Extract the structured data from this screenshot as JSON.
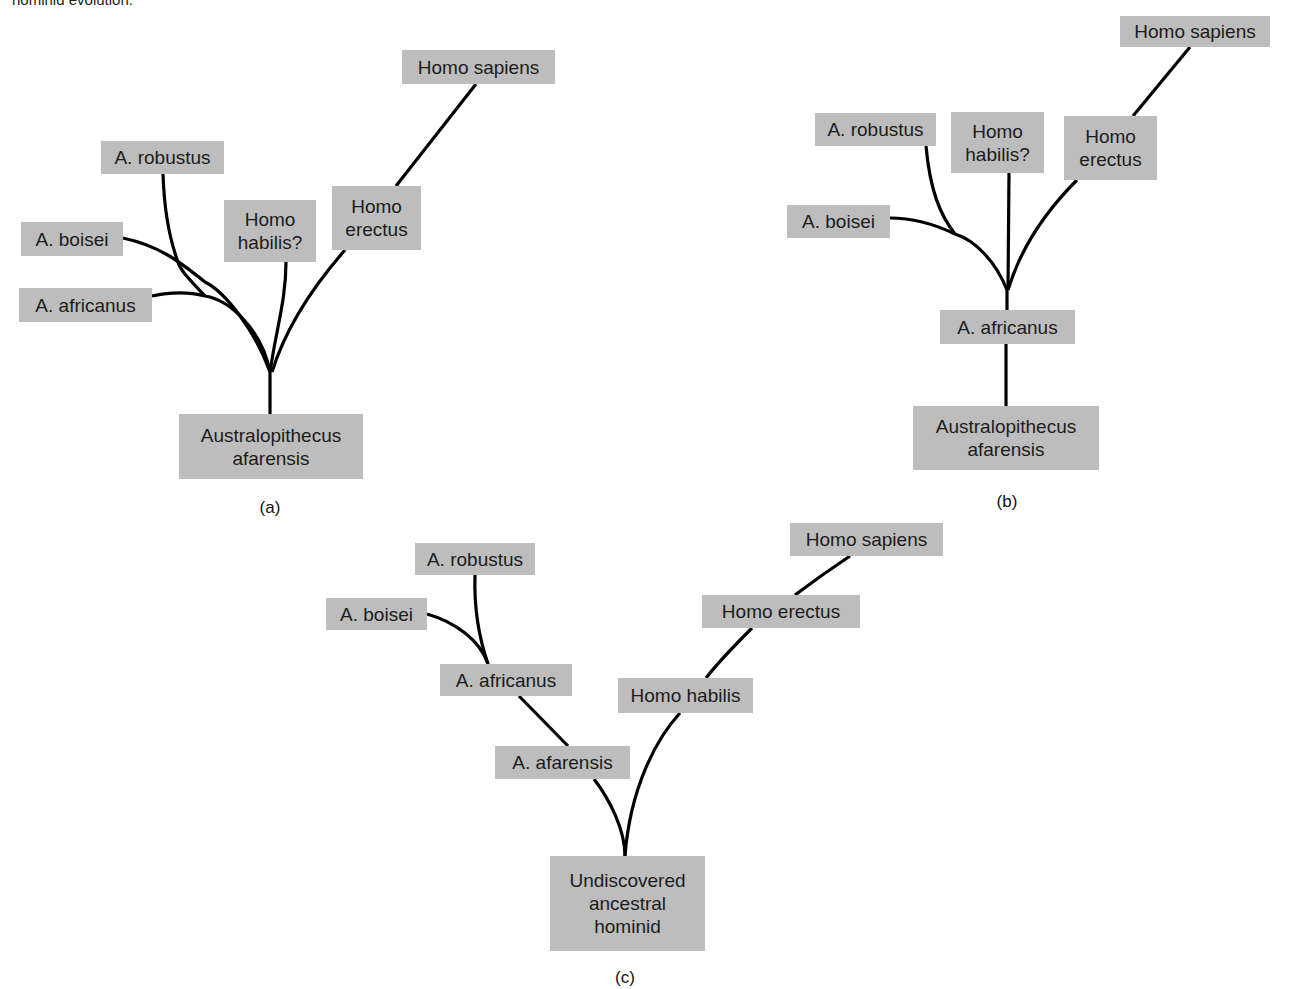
{
  "header_fragment": "hominid evolution.",
  "panels": {
    "a": {
      "caption": "(a)",
      "nodes": {
        "robustus": "A. robustus",
        "boisei": "A. boisei",
        "africanus": "A. africanus",
        "habilis": "Homo\nhabilis?",
        "erectus": "Homo\nerectus",
        "sapiens": "Homo sapiens",
        "afarensis": "Australopithecus\nafarensis"
      }
    },
    "b": {
      "caption": "(b)",
      "nodes": {
        "sapiens": "Homo sapiens",
        "robustus": "A. robustus",
        "habilis": "Homo\nhabilis?",
        "erectus": "Homo\nerectus",
        "boisei": "A. boisei",
        "africanus": "A. africanus",
        "afarensis": "Australopithecus\nafarensis"
      }
    },
    "c": {
      "caption": "(c)",
      "nodes": {
        "robustus": "A. robustus",
        "boisei": "A. boisei",
        "africanus": "A. africanus",
        "afarensis": "A. afarensis",
        "sapiens": "Homo sapiens",
        "erectus": "Homo erectus",
        "habilis": "Homo habilis",
        "ancestor": "Undiscovered\nancestral\nhominid"
      }
    }
  },
  "colors": {
    "box_fill": "#bdbdbd",
    "line": "#000000",
    "text": "#1c1c1c"
  }
}
